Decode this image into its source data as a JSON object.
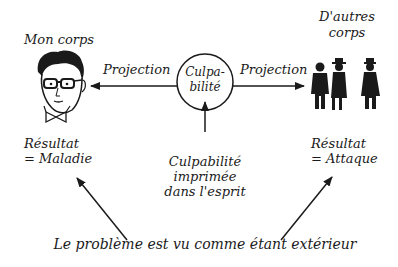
{
  "diagram": {
    "left_node": {
      "title": "Mon corps",
      "icon": "face-with-glasses-icon",
      "result_line1": "Résultat",
      "result_line2": "= Maladie"
    },
    "right_node": {
      "title_line1": "D'autres",
      "title_line2": "corps",
      "icon": "silhouettes-people-icon",
      "result_line1": "Résultat",
      "result_line2": "= Attaque"
    },
    "center_node": {
      "circle_line1": "Culpa-",
      "circle_line2": "bilité",
      "source_line1": "Culpabilité",
      "source_line2": "imprimée",
      "source_line3": "dans l'esprit"
    },
    "arrows": {
      "left_label": "Projection",
      "right_label": "Projection"
    },
    "bottom_caption": "Le problème est vu comme étant extérieur",
    "colors": {
      "ink": "#1a1a1a",
      "background": "#ffffff"
    }
  }
}
